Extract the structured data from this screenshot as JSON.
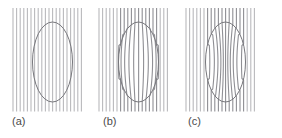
{
  "figure": {
    "background_color": "#ffffff",
    "width": 282,
    "height": 138,
    "line_color": "#b9b9bc",
    "line_color_dark": "#8f8f94",
    "ellipse_color": "#77777c",
    "label_color": "#4a4a4a"
  },
  "panels": [
    {
      "id": "panel-a",
      "label": "(a)",
      "distortion": "none",
      "label_x": 12,
      "label_y": 115,
      "field": {
        "x": 13,
        "y": 8,
        "width": 72,
        "height": 104
      },
      "lines": {
        "count": 20,
        "spacing": 3.6,
        "stroke_width": 1.1
      },
      "ellipse": {
        "cx": 52.5,
        "cy": 62,
        "rx": 20,
        "ry": 40,
        "stroke_width": 1.0
      },
      "amplitude": 0
    },
    {
      "id": "panel-b",
      "label": "(b)",
      "distortion": "barrel-outward",
      "label_x": 103,
      "label_y": 115,
      "field": {
        "x": 99,
        "y": 8,
        "width": 72,
        "height": 104
      },
      "lines": {
        "count": 20,
        "spacing": 3.6,
        "stroke_width": 1.1
      },
      "ellipse": {
        "cx": 138.5,
        "cy": 62,
        "rx": 20,
        "ry": 40,
        "stroke_width": 1.0
      },
      "amplitude": 5.0
    },
    {
      "id": "panel-c",
      "label": "(c)",
      "distortion": "pincushion-inward",
      "label_x": 188,
      "label_y": 115,
      "field": {
        "x": 186,
        "y": 8,
        "width": 72,
        "height": 104
      },
      "lines": {
        "count": 20,
        "spacing": 3.6,
        "stroke_width": 1.1
      },
      "ellipse": {
        "cx": 225.5,
        "cy": 62,
        "rx": 20,
        "ry": 40,
        "stroke_width": 1.0
      },
      "amplitude": -5.0
    }
  ]
}
